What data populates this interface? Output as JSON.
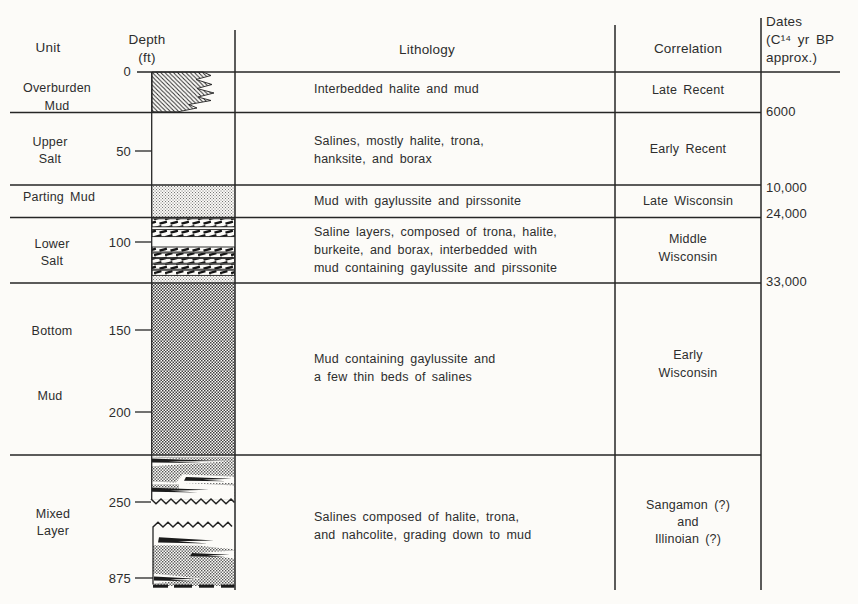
{
  "colors": {
    "background": "#fcfbf8",
    "line": "#262626",
    "text": "#2d2d2d"
  },
  "header": {
    "unit": "Unit",
    "depth1": "Depth",
    "depth2": "(ft)",
    "lithology": "Lithology",
    "correlation": "Correlation",
    "dates1": "Dates",
    "dates2": "(C¹⁴ yr BP",
    "dates3": "approx.)"
  },
  "depth_ticks": [
    "0",
    "50",
    "100",
    "150",
    "200",
    "250",
    "875"
  ],
  "dates": [
    "6000",
    "10,000",
    "24,000",
    "33,000"
  ],
  "rows": [
    {
      "unit": [
        "Overburden",
        "Mud"
      ],
      "lithology": [
        "Interbedded halite and mud"
      ],
      "correlation": [
        "Late Recent"
      ],
      "pattern": "diagonal-hatch-jagged-edge"
    },
    {
      "unit": [
        "Upper",
        "Salt"
      ],
      "lithology": [
        "Salines, mostly halite, trona,",
        "hanksite, and borax"
      ],
      "correlation": [
        "Early Recent"
      ],
      "pattern": "blank"
    },
    {
      "unit": [
        "Parting Mud"
      ],
      "lithology": [
        "Mud with gaylussite and pirssonite"
      ],
      "correlation": [
        "Late Wisconsin"
      ],
      "pattern": "light-stipple"
    },
    {
      "unit": [
        "Lower",
        "Salt"
      ],
      "lithology": [
        "Saline layers, composed of trona, halite,",
        "burkeite, and borax, interbedded with",
        "mud containing gaylussite and pirssonite"
      ],
      "correlation": [
        "Middle",
        "Wisconsin"
      ],
      "pattern": "saline-dash-bands-with-mud-interbeds"
    },
    {
      "unit": [
        "Bottom",
        "Mud"
      ],
      "lithology": [
        "Mud containing gaylussite and",
        "a few thin beds of salines"
      ],
      "correlation": [
        "Early",
        "Wisconsin"
      ],
      "pattern": "checkered-stipple"
    },
    {
      "unit": [
        "Mixed",
        "Layer"
      ],
      "lithology": [
        "Salines composed of halite, trona,",
        "and nahcolite, grading down to mud"
      ],
      "correlation": [
        "Sangamon (?)",
        "and",
        "Illinoian (?)"
      ],
      "pattern": "stipple-with-salt-lenses-wavy-break-dashed-base"
    }
  ]
}
